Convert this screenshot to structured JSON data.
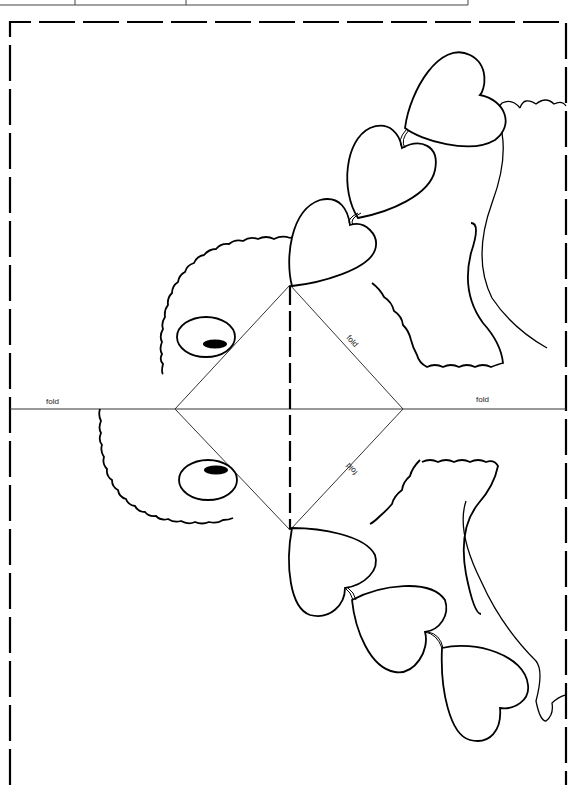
{
  "page": {
    "type": "craft cutout template"
  },
  "labels": {
    "fold_left": "fold",
    "fold_right": "fold",
    "fold_diag_upper": "fold",
    "fold_diag_lower": "fold"
  },
  "colors": {
    "ink": "#000000",
    "paper": "#ffffff",
    "thin_line": "#333333"
  },
  "elements": {
    "cut_border": "dashed cut line",
    "center_fold": "horizontal fold line",
    "vertical_cut": "dashed center cut",
    "diamond": "pop-up fold diamond",
    "chick_head": "scalloped head outline",
    "eyes": 2,
    "hearts": 6,
    "wings": 2
  }
}
